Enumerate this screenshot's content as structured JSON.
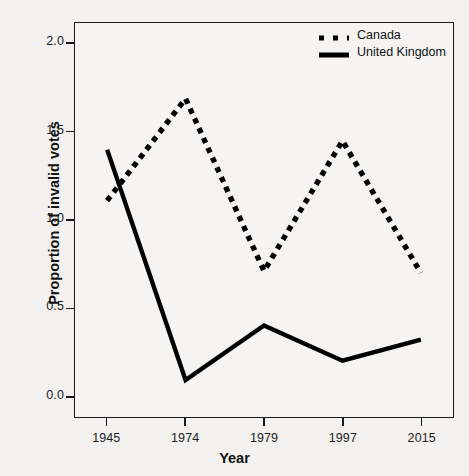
{
  "chart_data": {
    "type": "line",
    "title": "",
    "xlabel": "Year",
    "ylabel": "Proportion of invalid votes",
    "categories": [
      "1945",
      "1974",
      "1979",
      "1997",
      "2015"
    ],
    "xticklabels": [
      "1945",
      "1974",
      "1979",
      "1997",
      "2015"
    ],
    "yticklabels": [
      "0.0",
      "0.5",
      "1.0",
      "1.5",
      "2.0"
    ],
    "ytickvalues": [
      0.0,
      0.5,
      1.0,
      1.5,
      2.0
    ],
    "ylim": [
      -0.12,
      2.12
    ],
    "grid": false,
    "legend_position": "top-right",
    "series": [
      {
        "name": "Canada",
        "values": [
          1.11,
          1.69,
          0.71,
          1.45,
          0.7
        ],
        "linestyle": "dotted",
        "color": "#000000"
      },
      {
        "name": "United Kingdom",
        "values": [
          1.4,
          0.09,
          0.4,
          0.2,
          0.32
        ],
        "linestyle": "solid",
        "color": "#000000"
      }
    ]
  },
  "legend": {
    "entries": [
      {
        "label": "Canada",
        "swatch": "dotted-line-swatch"
      },
      {
        "label": "United Kingdom",
        "swatch": "solid-line-swatch"
      }
    ]
  },
  "axes": {
    "x_title": "Year",
    "y_title": "Proportion of invalid votes"
  },
  "colors": {
    "ink": "#000000",
    "frame": "#1a1a1a",
    "figure_background": "#f2f1ef",
    "plot_background": "#f5f4f2"
  }
}
